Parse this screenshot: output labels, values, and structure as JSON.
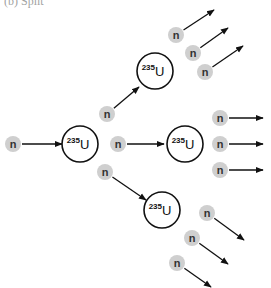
{
  "caption": "(b) Split",
  "colors": {
    "neutron_fill": "#cfcfcf",
    "nucleus_stroke": "#111111",
    "arrow": "#111111",
    "background": "#ffffff"
  },
  "neutron": {
    "label": "n"
  },
  "nucleus": {
    "mass_number": "235",
    "symbol": "U"
  },
  "incoming_neutron": {
    "x": 13,
    "y": 144,
    "arrow_to": [
      62,
      144
    ]
  },
  "nuclei": [
    {
      "id": "central",
      "x": 80,
      "y": 144,
      "r": 18
    },
    {
      "id": "top",
      "x": 155,
      "y": 71,
      "r": 18
    },
    {
      "id": "middle",
      "x": 185,
      "y": 144,
      "r": 18
    },
    {
      "id": "bottom",
      "x": 162,
      "y": 210,
      "r": 18
    }
  ],
  "secondary_neutrons": [
    {
      "x": 107,
      "y": 114,
      "arrow_to": [
        139,
        87
      ]
    },
    {
      "x": 118,
      "y": 144,
      "arrow_to": [
        164,
        144
      ]
    },
    {
      "x": 105,
      "y": 172,
      "arrow_to": [
        146,
        200
      ]
    }
  ],
  "tertiary_neutrons": [
    {
      "group": "top",
      "x": 176,
      "y": 35,
      "arrow_to": [
        214,
        10
      ]
    },
    {
      "group": "top",
      "x": 193,
      "y": 53,
      "arrow_to": [
        228,
        28
      ]
    },
    {
      "group": "top",
      "x": 205,
      "y": 72,
      "arrow_to": [
        243,
        46
      ]
    },
    {
      "group": "middle",
      "x": 220,
      "y": 118,
      "arrow_to": [
        263,
        118
      ]
    },
    {
      "group": "middle",
      "x": 220,
      "y": 144,
      "arrow_to": [
        263,
        144
      ]
    },
    {
      "group": "middle",
      "x": 220,
      "y": 170,
      "arrow_to": [
        263,
        170
      ]
    },
    {
      "group": "bottom",
      "x": 207,
      "y": 213,
      "arrow_to": [
        244,
        240
      ]
    },
    {
      "group": "bottom",
      "x": 192,
      "y": 238,
      "arrow_to": [
        228,
        264
      ]
    },
    {
      "group": "bottom",
      "x": 177,
      "y": 263,
      "arrow_to": [
        211,
        287
      ]
    }
  ]
}
